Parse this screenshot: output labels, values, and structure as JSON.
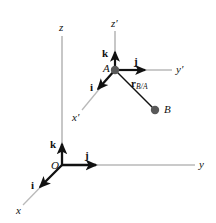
{
  "figure": {
    "background_color": "#ffffff",
    "ink_color": "#111111",
    "thin_axis_color": "#b9b9b9",
    "node_color": "#595959",
    "width": 216,
    "height": 223
  },
  "fixed_frame": {
    "origin_label": "O",
    "axes": [
      {
        "name": "x-axis",
        "label": "x"
      },
      {
        "name": "y-axis",
        "label": "y"
      },
      {
        "name": "z-axis",
        "label": "z"
      }
    ],
    "unit_vectors": [
      {
        "name": "i-unit-vector",
        "label": "i",
        "direction": "down-left along x"
      },
      {
        "name": "j-unit-vector",
        "label": "j",
        "direction": "right along y"
      },
      {
        "name": "k-unit-vector",
        "label": "k",
        "direction": "up along z"
      }
    ]
  },
  "moving_frame": {
    "origin_label": "A",
    "axes": [
      {
        "name": "x-prime-axis",
        "label": "x",
        "prime": "′"
      },
      {
        "name": "y-prime-axis",
        "label": "y",
        "prime": "′"
      },
      {
        "name": "z-prime-axis",
        "label": "z",
        "prime": "′"
      }
    ],
    "unit_vectors": [
      {
        "name": "i-prime-unit-vector",
        "label": "i",
        "direction": "down-left along x-prime"
      },
      {
        "name": "j-prime-unit-vector",
        "label": "j",
        "direction": "right along y-prime"
      },
      {
        "name": "k-prime-unit-vector",
        "label": "k",
        "direction": "up along z-prime"
      }
    ]
  },
  "points": [
    {
      "name": "point-a",
      "label": "A"
    },
    {
      "name": "point-b",
      "label": "B"
    }
  ],
  "vectors": [
    {
      "name": "relative-position-vector",
      "symbol": "r",
      "subscript": "B/A",
      "from": "A",
      "to": "B"
    }
  ]
}
